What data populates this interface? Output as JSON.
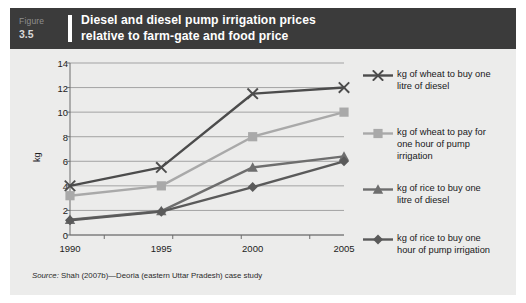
{
  "figure": {
    "tag_word": "Figure",
    "tag_number": "3.5",
    "title_line1": "Diesel and diesel pump irrigation prices",
    "title_line2": "relative to farm-gate and food price",
    "source_prefix": "Source:",
    "source_text": " Shah (2007b)—Deoria (eastern Uttar Pradesh) case study"
  },
  "colors": {
    "header_bg": "#3b3b3b",
    "panel_bg": "#ececeb",
    "wheat_diesel": "#4c4c4c",
    "wheat_pump": "#a9a9a9",
    "rice_diesel": "#6e6e6e",
    "rice_pump": "#5a5a5a",
    "grid": "#9b9b9b",
    "axis": "#6d6d6d"
  },
  "chart_data": {
    "type": "line",
    "title": "Diesel and diesel pump irrigation prices relative to farm-gate and food price",
    "xlabel": "",
    "ylabel": "kg",
    "categories": [
      "1990",
      "1995",
      "2000",
      "2005"
    ],
    "ylim": [
      0,
      14
    ],
    "yticks": [
      "0",
      "2",
      "4",
      "6",
      "8",
      "10",
      "12",
      "14"
    ],
    "grid": true,
    "legend_position": "right",
    "series": [
      {
        "name": "kg of wheat to buy one litre of diesel",
        "label_lines": [
          "kg of wheat to buy one",
          "litre of diesel"
        ],
        "marker": "x",
        "color": "#4c4c4c",
        "values": [
          4.0,
          5.5,
          11.5,
          12.0
        ]
      },
      {
        "name": "kg of wheat to pay for one hour of pump irrigation",
        "label_lines": [
          "kg of wheat to pay for",
          "one hour of pump",
          "irrigation"
        ],
        "marker": "square",
        "color": "#a9a9a9",
        "values": [
          3.2,
          4.0,
          8.0,
          10.0
        ]
      },
      {
        "name": "kg of rice to buy one litre of diesel",
        "label_lines": [
          "kg of rice to buy one",
          "litre of diesel"
        ],
        "marker": "triangle",
        "color": "#6e6e6e",
        "values": [
          1.25,
          1.95,
          5.5,
          6.4
        ]
      },
      {
        "name": "kg of rice to buy one hour of pump irrigation",
        "label_lines": [
          "kg of rice to buy one",
          "hour of pump irrigation"
        ],
        "marker": "diamond",
        "color": "#5a5a5a",
        "values": [
          1.2,
          1.9,
          3.9,
          6.0
        ]
      }
    ]
  }
}
